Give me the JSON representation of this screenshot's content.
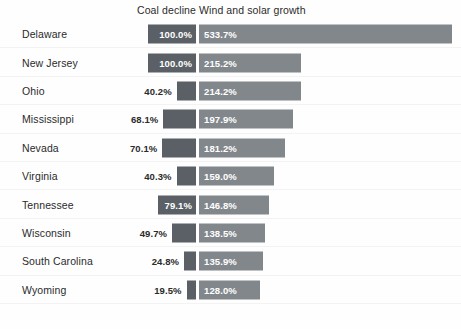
{
  "chart_data": {
    "type": "bar",
    "title": "",
    "subtitle": "",
    "xlabel": "",
    "ylabel": "",
    "grid": false,
    "legend_position": "top",
    "orientation": "horizontal",
    "layout": "diverging-paired-bars",
    "axis_note": "Coal decline bars are right-aligned and grow leftward; Wind and solar growth bars are left-aligned and grow rightward from a shared center axis.",
    "categories": [
      "Delaware",
      "New Jersey",
      "Ohio",
      "Mississippi",
      "Nevada",
      "Virginia",
      "Tennessee",
      "Wisconsin",
      "South Carolina",
      "Wyoming"
    ],
    "series": [
      {
        "name": "Coal decline",
        "unit": "%",
        "color": "#5a6066",
        "values": [
          100.0,
          100.0,
          40.2,
          68.1,
          70.1,
          40.3,
          79.1,
          49.7,
          24.8,
          19.5
        ],
        "labels": [
          "100.0%",
          "100.0%",
          "40.2%",
          "68.1%",
          "70.1%",
          "40.3%",
          "79.1%",
          "49.7%",
          "24.8%",
          "19.5%"
        ],
        "max_for_scale": 100.0
      },
      {
        "name": "Wind and solar growth",
        "unit": "%",
        "color": "#82878c",
        "values": [
          533.7,
          215.2,
          214.2,
          197.9,
          181.2,
          159.0,
          146.8,
          138.5,
          135.9,
          128.0
        ],
        "labels": [
          "533.7%",
          "215.2%",
          "214.2%",
          "197.9%",
          "181.2%",
          "159.0%",
          "146.8%",
          "138.5%",
          "135.9%",
          "128.0%"
        ],
        "max_for_scale": 533.7
      }
    ],
    "rows": [
      {
        "state": "Delaware",
        "coal": "100.0%",
        "wind": "533.7%"
      },
      {
        "state": "New Jersey",
        "coal": "100.0%",
        "wind": "215.2%"
      },
      {
        "state": "Ohio",
        "coal": "40.2%",
        "wind": "214.2%"
      },
      {
        "state": "Mississippi",
        "coal": "68.1%",
        "wind": "197.9%"
      },
      {
        "state": "Nevada",
        "coal": "70.1%",
        "wind": "181.2%"
      },
      {
        "state": "Virginia",
        "coal": "40.3%",
        "wind": "159.0%"
      },
      {
        "state": "Tennessee",
        "coal": "79.1%",
        "wind": "146.8%"
      },
      {
        "state": "Wisconsin",
        "coal": "49.7%",
        "wind": "138.5%"
      },
      {
        "state": "South Carolina",
        "coal": "24.8%",
        "wind": "135.9%"
      },
      {
        "state": "Wyoming",
        "coal": "19.5%",
        "wind": "128.0%"
      }
    ]
  },
  "headers": {
    "coal": "Coal decline",
    "wind": "Wind and solar growth"
  },
  "colors": {
    "coal_bar": "#5a6066",
    "wind_bar": "#82878c",
    "text": "#2b2b2b",
    "bar_label": "#ffffff",
    "background": "#fefefe",
    "row_rule": "#f3f3f3"
  }
}
